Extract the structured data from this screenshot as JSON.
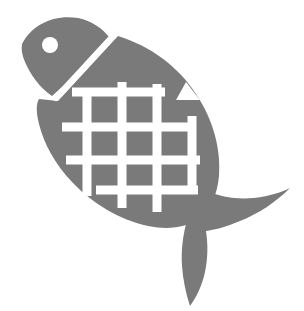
{
  "image": {
    "title": "Fish Pictogram",
    "subject": "fish",
    "style": "flat silhouette icon",
    "width": 304,
    "height": 311,
    "background_color": "#ffffff",
    "figure_color": "#7a7a7a",
    "accent_color": "#ffffff"
  },
  "shapes": {
    "head": {
      "name": "fish-head",
      "color": "#7a7a7a",
      "path": "M 22 44 C 32 24 55 14 78 18 C 92 21 102 28 110 38 L 92 58 L 72 78 L 52 96 C 40 88 30 74 25 62 C 22 55 21 49 22 44 Z"
    },
    "gill_line": {
      "name": "fish-gill-line",
      "color": "#ffffff",
      "stroke_width": 6,
      "path": "M 113 36 C 98 52 78 74 56 98"
    },
    "eye": {
      "name": "fish-eye",
      "color": "#ffffff",
      "cx": 50,
      "cy": 45,
      "r": 8
    },
    "body": {
      "name": "fish-body",
      "color": "#7a7a7a",
      "path": "M 118 36 C 150 46 178 66 196 94 C 214 121 221 150 219 176 C 217 196 210 210 200 218 C 186 228 168 230 148 226 C 120 220 93 204 72 182 C 55 164 44 144 39 124 C 36 112 36 104 39 99 L 58 101 Z"
    },
    "dorsal_notch": {
      "name": "fish-dorsal-notch",
      "color": "#ffffff",
      "path": "M 186 82 L 200 100 L 176 100 Z"
    },
    "tail": {
      "name": "fish-tail",
      "color": "#7a7a7a",
      "path": "M 196 186 C 214 196 234 200 254 198 C 270 196 282 192 290 188 C 276 202 258 214 240 221 C 226 227 214 230 206 231 C 208 244 208 258 205 272 C 202 286 196 298 190 306 C 186 294 183 280 182 266 C 181 250 183 236 186 224 C 180 220 176 214 175 206 C 174 198 177 190 182 184 Z"
    },
    "grid": {
      "name": "fish-scale-grid",
      "color": "#ffffff",
      "line_width": 9,
      "vertical_lines": [
        {
          "x": 87,
          "y1": 88,
          "y2": 196
        },
        {
          "x": 122,
          "y1": 82,
          "y2": 208
        },
        {
          "x": 157,
          "y1": 84,
          "y2": 212
        },
        {
          "x": 192,
          "y1": 116,
          "y2": 192
        }
      ],
      "horizontal_lines": [
        {
          "y": 92,
          "x1": 72,
          "x2": 165
        },
        {
          "y": 127,
          "x1": 62,
          "x2": 196
        },
        {
          "y": 160,
          "x1": 66,
          "x2": 200
        },
        {
          "y": 190,
          "x1": 96,
          "x2": 198
        }
      ]
    }
  }
}
